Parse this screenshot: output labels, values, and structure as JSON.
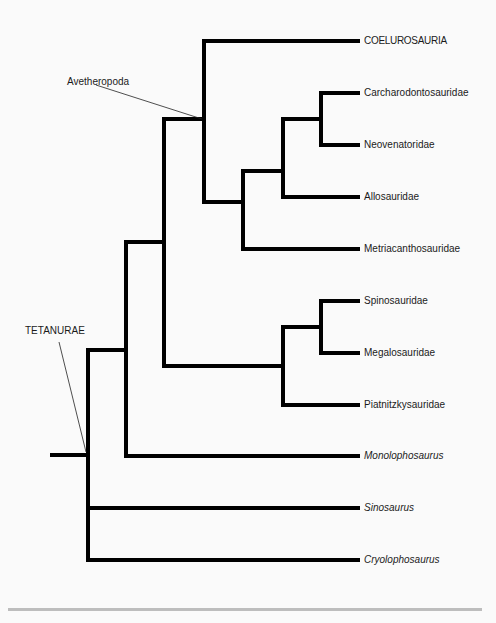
{
  "diagram": {
    "type": "cladogram",
    "colors": {
      "background": "#fafafa",
      "branch": "#000000",
      "text": "#1a1a1a",
      "divider": "#bdbdbd"
    },
    "clade_labels": {
      "avetheropoda": "Avetheropoda",
      "tetanurae": "TETANURAE"
    },
    "taxa": [
      {
        "name": "COELUROSAURIA",
        "italic": false
      },
      {
        "name": "Carcharodontosauridae",
        "italic": false
      },
      {
        "name": "Neovenatoridae",
        "italic": false
      },
      {
        "name": "Allosauridae",
        "italic": false
      },
      {
        "name": "Metriacanthosauridae",
        "italic": false
      },
      {
        "name": "Spinosauridae",
        "italic": false
      },
      {
        "name": "Megalosauridae",
        "italic": false
      },
      {
        "name": "Piatnitzkysauridae",
        "italic": false
      },
      {
        "name": "Monolophosaurus",
        "italic": true
      },
      {
        "name": "Sinosaurus",
        "italic": true
      },
      {
        "name": "Cryolophosaurus",
        "italic": true
      }
    ],
    "topology": "(((((COELUROSAURIA,(((Carcharodontosauridae,Neovenatoridae),Allosauridae),Metriacanthosauridae))Avetheropoda,((Spinosauridae,Megalosauridae),Piatnitzkysauridae)),Monolophosaurus),Sinosaurus,Cryolophosaurus)TETANURAE)"
  }
}
